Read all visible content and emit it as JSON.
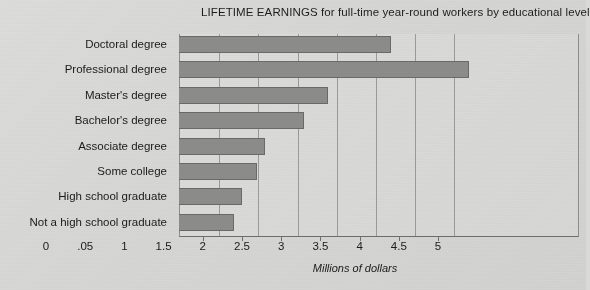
{
  "chart_data": {
    "type": "bar",
    "orientation": "horizontal",
    "title": "LIFETIME EARNINGS for full-time year-round workers by educational level",
    "xlabel": "Millions of dollars",
    "ylabel": "",
    "categories": [
      "Doctoral degree",
      "Professional degree",
      "Master's degree",
      "Bachelor's degree",
      "Associate degree",
      "Some college",
      "High school graduate",
      "Not a high school graduate"
    ],
    "values": [
      4.2,
      5.2,
      3.4,
      3.1,
      2.6,
      2.5,
      2.3,
      2.2
    ],
    "xlim": [
      1.5,
      5.55
    ],
    "x_tick_labels": [
      "0",
      ".05",
      "1",
      "1.5",
      "2",
      "2.5",
      "3",
      "3.5",
      "4",
      "4.5",
      "5"
    ],
    "x_tick_values": [
      0,
      0.5,
      1,
      1.5,
      2,
      2.5,
      3,
      3.5,
      4,
      4.5,
      5
    ],
    "gridlines": true,
    "grid_axis": "x",
    "legend": false,
    "bar_color": "#8c8c8a",
    "bar_border_color": "#6a6a68",
    "background_color": "#d9d9d7",
    "text_color": "#1b1b1b"
  }
}
